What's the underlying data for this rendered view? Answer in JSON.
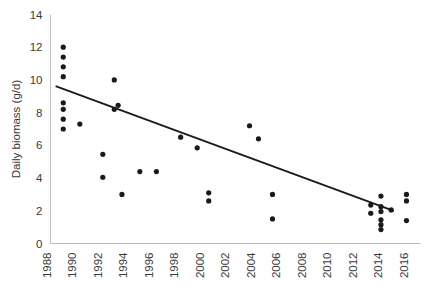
{
  "chart_data": {
    "type": "scatter",
    "title": "",
    "xlabel": "",
    "ylabel": "Daily biomass (g/d)",
    "xlim": [
      1988,
      2017
    ],
    "ylim": [
      0,
      14
    ],
    "xticks": [
      1988,
      1990,
      1992,
      1994,
      1996,
      1998,
      2000,
      2002,
      2004,
      2006,
      2008,
      2010,
      2012,
      2014,
      2016
    ],
    "xticklabels": [
      "1988",
      "1990",
      "1992",
      "1994",
      "1996",
      "1998",
      "2000",
      "2002",
      "2004",
      "2006",
      "2008",
      "2010",
      "2012",
      "2014",
      "2016"
    ],
    "yticks": [
      0,
      2,
      4,
      6,
      8,
      10,
      12,
      14
    ],
    "yticklabels": [
      "0",
      "2",
      "4",
      "6",
      "8",
      "10",
      "12",
      "14"
    ],
    "grid": false,
    "legend": false,
    "xtick_rotation": 90,
    "marker": "circle",
    "marker_color": "#1a1a1a",
    "marker_size": 2.6,
    "axis_color": "#bfbfbf",
    "text_color": "#3a3a3a",
    "background": "#ffffff",
    "series": [
      {
        "name": "Daily biomass observations",
        "points": [
          [
            1989.0,
            12.0
          ],
          [
            1989.0,
            11.4
          ],
          [
            1989.0,
            10.8
          ],
          [
            1989.0,
            10.2
          ],
          [
            1989.0,
            8.6
          ],
          [
            1989.0,
            8.2
          ],
          [
            1989.0,
            7.6
          ],
          [
            1989.0,
            7.0
          ],
          [
            1990.3,
            7.3
          ],
          [
            1992.1,
            5.45
          ],
          [
            1992.1,
            4.05
          ],
          [
            1993.0,
            10.0
          ],
          [
            1993.0,
            8.2
          ],
          [
            1993.3,
            8.45
          ],
          [
            1993.6,
            3.0
          ],
          [
            1995.0,
            4.4
          ],
          [
            1996.3,
            4.4
          ],
          [
            1998.2,
            6.5
          ],
          [
            1999.5,
            5.85
          ],
          [
            2000.4,
            3.1
          ],
          [
            2000.4,
            2.6
          ],
          [
            2003.6,
            7.2
          ],
          [
            2004.3,
            6.4
          ],
          [
            2005.4,
            3.0
          ],
          [
            2005.4,
            1.5
          ],
          [
            2013.1,
            2.35
          ],
          [
            2013.1,
            1.85
          ],
          [
            2013.9,
            2.9
          ],
          [
            2013.9,
            2.25
          ],
          [
            2013.9,
            1.95
          ],
          [
            2013.9,
            1.45
          ],
          [
            2013.9,
            1.15
          ],
          [
            2013.9,
            0.85
          ],
          [
            2014.7,
            2.05
          ],
          [
            2015.9,
            3.0
          ],
          [
            2015.9,
            2.6
          ],
          [
            2015.9,
            1.4
          ]
        ]
      }
    ],
    "trendline": {
      "name": "linear trend",
      "x_start": 1988.4,
      "y_start": 9.62,
      "x_end": 2014.9,
      "y_end": 2.0,
      "color": "#1a1a1a",
      "width": 1.8
    }
  }
}
